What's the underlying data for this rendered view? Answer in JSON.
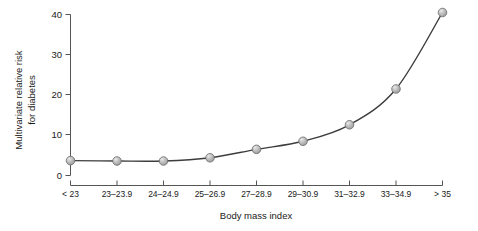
{
  "chart_data": {
    "type": "line",
    "title": "",
    "xlabel": "Body mass index",
    "ylabel_line1": "Multivariate relative risk",
    "ylabel_line2": "for diabetes",
    "categories": [
      "< 23",
      "23–23.9",
      "24–24.9",
      "25–26.9",
      "27–28.9",
      "29–30.9",
      "31–32.9",
      "33–34.9",
      "> 35"
    ],
    "values": [
      3.7,
      3.6,
      3.6,
      4.4,
      6.5,
      8.5,
      12.6,
      21.5,
      40.5
    ],
    "ylim": [
      0,
      40
    ],
    "yticks": [
      0,
      10,
      20,
      30,
      40
    ],
    "ytick_labels": [
      "0",
      "10",
      "20",
      "30",
      "40"
    ],
    "grid": false,
    "legend": false,
    "marker_style": "sphere",
    "colors": {
      "line": "#3d3d3d",
      "marker_fill": "#b5b5b5",
      "marker_edge": "#6b6b6b",
      "marker_highlight": "#e8e8e8",
      "axis": "#555555",
      "text": "#1a1a1a",
      "background": "#ffffff"
    }
  },
  "axes": {
    "y_tick_0": "0",
    "y_tick_1": "10",
    "y_tick_2": "20",
    "y_tick_3": "30",
    "y_tick_4": "40",
    "x_cat_0": "< 23",
    "x_cat_1": "23–23.9",
    "x_cat_2": "24–24.9",
    "x_cat_3": "25–26.9",
    "x_cat_4": "27–28.9",
    "x_cat_5": "29–30.9",
    "x_cat_6": "31–32.9",
    "x_cat_7": "33–34.9",
    "x_cat_8": "> 35",
    "x_title": "Body mass index",
    "y_title_line1": "Multivariate relative risk",
    "y_title_line2": "for diabetes"
  }
}
